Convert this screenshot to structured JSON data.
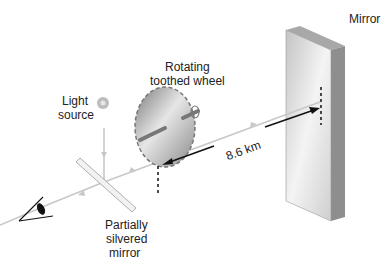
{
  "labels": {
    "mirror": "Mirror",
    "wheel_line1": "Rotating",
    "wheel_line2": "toothed wheel",
    "light_line1": "Light",
    "light_line2": "source",
    "partial_line1": "Partially",
    "partial_line2": "silvered",
    "partial_line3": "mirror",
    "distance": "8.6 km"
  },
  "colors": {
    "beam": "#c8c8c8",
    "arrow": "#111111",
    "mirror_face": "#d8d8d8",
    "mirror_side": "#9a9a9a",
    "wheel": "#8f8f8f"
  }
}
